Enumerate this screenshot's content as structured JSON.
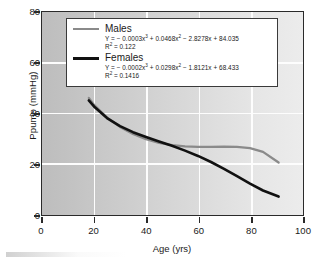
{
  "chart_data": {
    "type": "line",
    "title": "",
    "xlabel": "Age (yrs)",
    "ylabel": "Ppump (mmHg)",
    "xlim": [
      0,
      100
    ],
    "ylim": [
      0,
      80
    ],
    "xticks": [
      "0",
      "20",
      "40",
      "60",
      "80",
      "100"
    ],
    "yticks": [
      "0",
      "20",
      "40",
      "60",
      "80"
    ],
    "grid": "white gridlines at every tick, vertical and horizontal",
    "legend_position": "top-center inside axes",
    "series": [
      {
        "name": "Males",
        "color": "#8a8a8a",
        "equation": "Y = − 0.0003x³ + 0.0468x² − 2.8278x + 84.035",
        "r2_label": "R² = 0.122",
        "r2": 0.122,
        "coefficients": {
          "x3": -0.0003,
          "x2": 0.0468,
          "x1": -2.8278,
          "x0": 84.035
        },
        "x_range": [
          18,
          91
        ],
        "x": [
          18,
          20,
          25,
          30,
          35,
          40,
          45,
          50,
          55,
          60,
          65,
          70,
          75,
          80,
          85,
          91
        ],
        "values": [
          46.0,
          43.2,
          38.2,
          34.5,
          31.7,
          29.6,
          28.2,
          27.3,
          26.8,
          26.6,
          26.6,
          26.7,
          26.6,
          26.1,
          24.6,
          20.4
        ]
      },
      {
        "name": "Females",
        "color": "#111111",
        "equation": "Y = − 0.0002x³ + 0.0298x² − 1.8121x + 68.433",
        "r2_label": "R² = 0.1416",
        "r2": 0.1416,
        "coefficients": {
          "x3": -0.0002,
          "x2": 0.0298,
          "x1": -1.8121,
          "x0": 68.433
        },
        "x_range": [
          18,
          91
        ],
        "x": [
          18,
          20,
          25,
          30,
          35,
          40,
          45,
          50,
          55,
          60,
          65,
          70,
          75,
          80,
          85,
          91
        ],
        "values": [
          45.0,
          42.6,
          38.0,
          34.8,
          32.4,
          30.5,
          28.7,
          27.0,
          25.1,
          23.0,
          20.6,
          17.9,
          15.0,
          12.0,
          9.3,
          6.9
        ]
      }
    ]
  }
}
